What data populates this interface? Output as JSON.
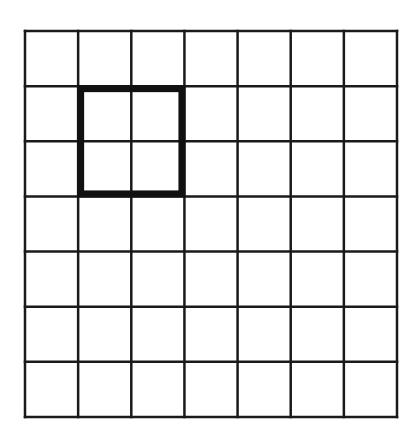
{
  "diagram": {
    "type": "grid",
    "rows": 7,
    "cols": 7,
    "bounds": {
      "x0": 25,
      "y0": 31,
      "x1": 397,
      "y1": 417
    },
    "grid_line_color": "#1a1a1a",
    "grid_line_width": 2.5,
    "highlight": {
      "label": "2x2 highlighted square",
      "col_start": 1,
      "row_start": 1,
      "col_span": 2,
      "row_span": 2,
      "color": "#111111",
      "stroke_width": 7
    },
    "background_color": "#ffffff"
  }
}
